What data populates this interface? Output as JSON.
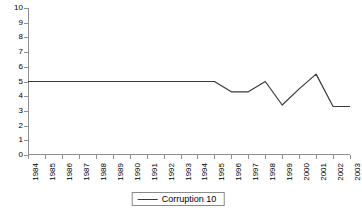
{
  "chart_data": {
    "type": "line",
    "title": "",
    "xlabel": "",
    "ylabel": "",
    "ylim": [
      0,
      10
    ],
    "ytick_step": 1,
    "grid": false,
    "legend_position": "bottom-center",
    "line_color": "#3a3a3a",
    "axis_color": "#909090",
    "categories": [
      "1984",
      "1985",
      "1986",
      "1987",
      "1988",
      "1989",
      "1990",
      "1991",
      "1992",
      "1993",
      "1994",
      "1995",
      "1996",
      "1997",
      "1998",
      "1999",
      "2000",
      "2001",
      "2002",
      "2003"
    ],
    "ytick_labels": [
      "0",
      "1",
      "2",
      "3",
      "4",
      "5",
      "6",
      "7",
      "8",
      "9",
      "10"
    ],
    "series": [
      {
        "name": "Corruption 10",
        "values": [
          5.0,
          5.0,
          5.0,
          5.0,
          5.0,
          5.0,
          5.0,
          5.0,
          5.0,
          5.0,
          5.0,
          5.0,
          4.3,
          4.3,
          5.0,
          3.4,
          4.5,
          5.5,
          3.3,
          3.3
        ]
      }
    ]
  },
  "legend": {
    "entries": [
      {
        "label": "Corruption 10",
        "marker": "line-swatch"
      }
    ]
  }
}
